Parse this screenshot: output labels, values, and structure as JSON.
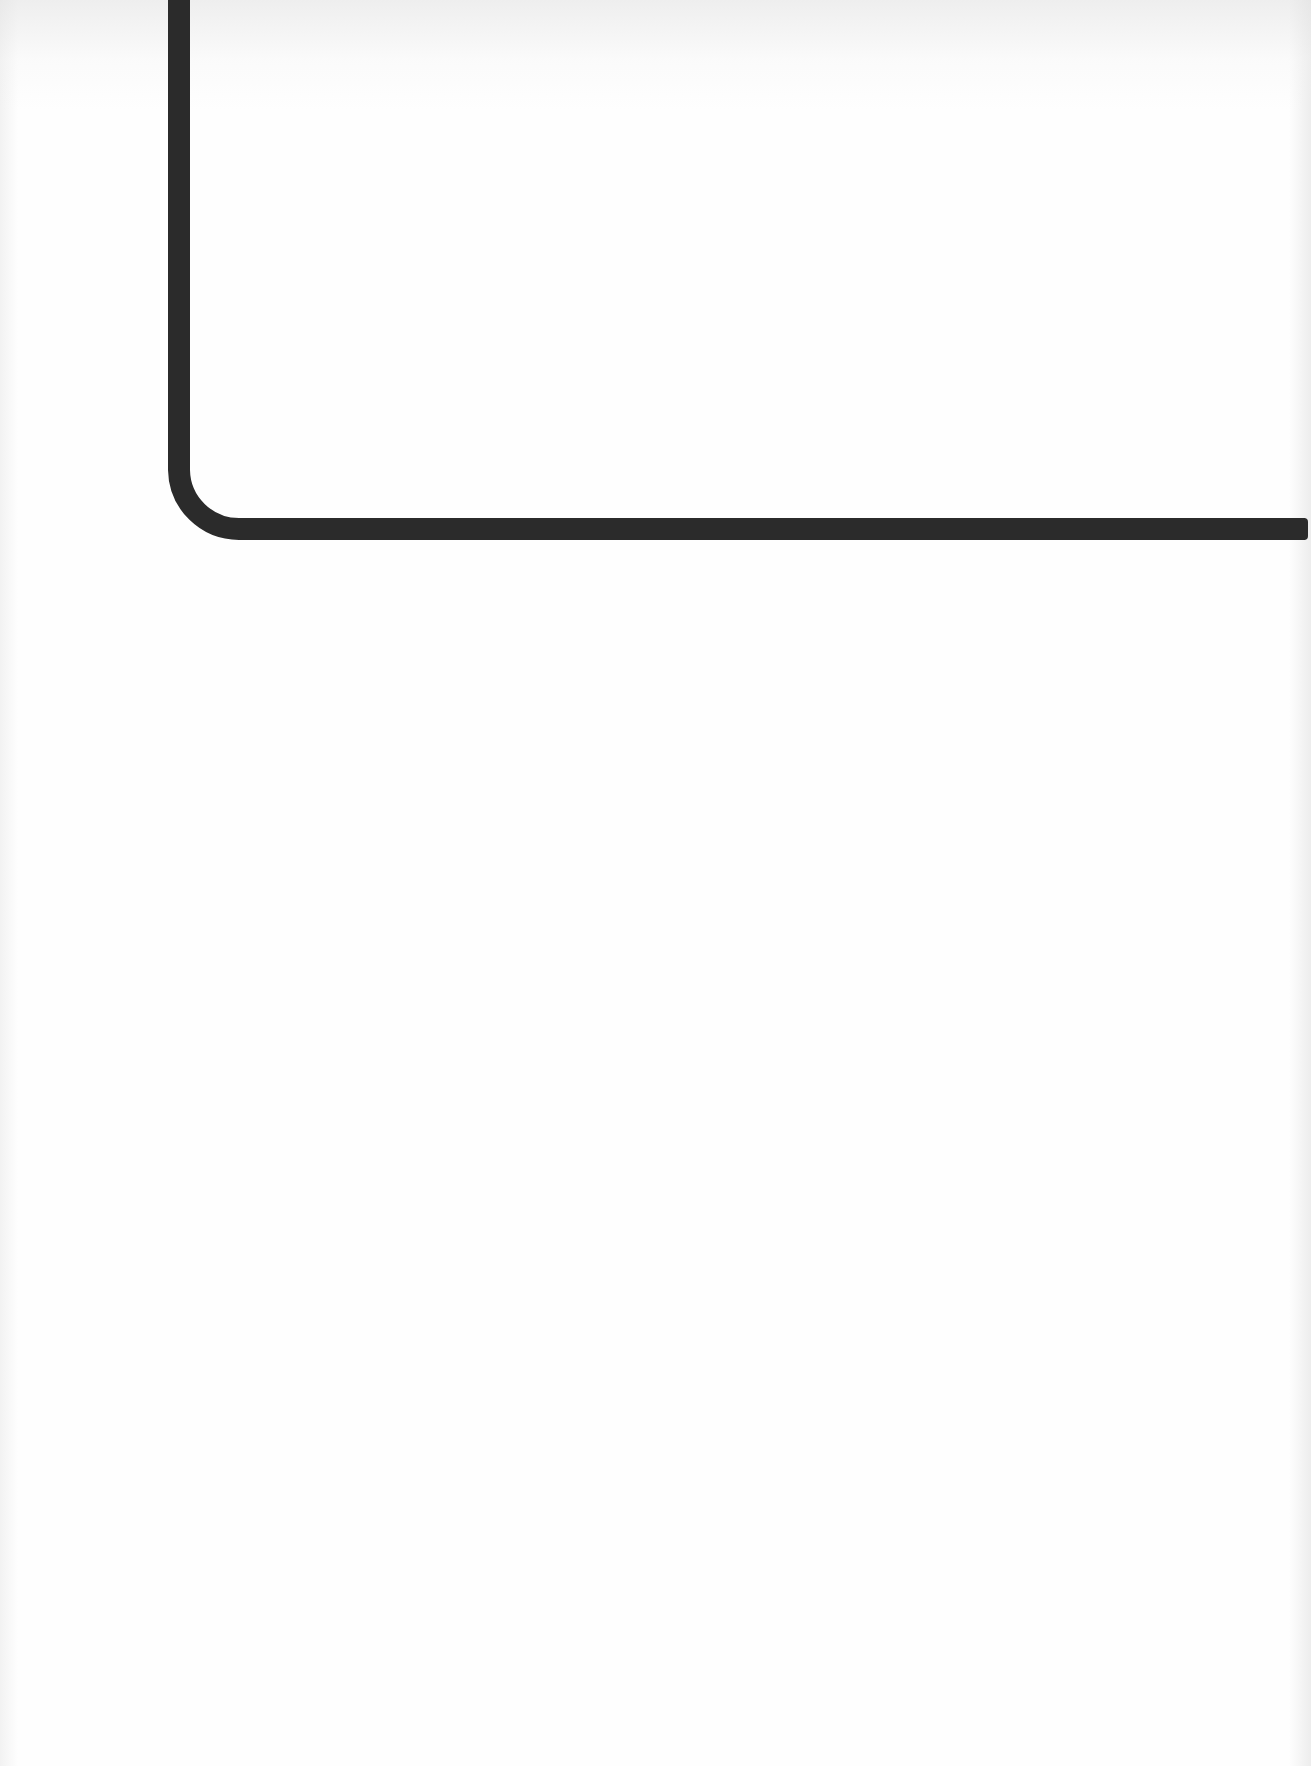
{
  "page": {
    "background_color": "#fefefe",
    "content": "blank scanned page with a thick L-shaped rule"
  },
  "decoration": {
    "rule_color": "#2b2b2b",
    "rule_thickness_px": 22,
    "shape": "L-shaped rule with rounded bottom-left corner"
  }
}
